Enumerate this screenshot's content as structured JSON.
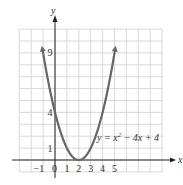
{
  "chart_data": {
    "type": "line",
    "title": "",
    "xlabel": "x",
    "ylabel": "y",
    "equation_label": "y = x² − 4x + 4",
    "equation_parts": {
      "pre": "y = x",
      "sup": "2",
      "post": " − 4x + 4"
    },
    "x_tick_labels": [
      "−1",
      "0",
      "1",
      "2",
      "3",
      "4",
      "5"
    ],
    "y_tick_labels": [
      "1",
      "4",
      "9"
    ],
    "xlim": [
      -3,
      9
    ],
    "ylim": [
      -1,
      11
    ],
    "grid": true,
    "series": [
      {
        "name": "y = x^2 - 4x + 4",
        "x": [
          -1.1,
          -1,
          0,
          1,
          2,
          3,
          4,
          5,
          5.1
        ],
        "y": [
          9.61,
          9,
          4,
          1,
          0,
          1,
          4,
          9,
          9.61
        ]
      }
    ],
    "vertex": [
      2,
      0
    ],
    "colors": {
      "curve": "#666666",
      "grid": "#cfcfcf",
      "axis": "#222222"
    }
  }
}
